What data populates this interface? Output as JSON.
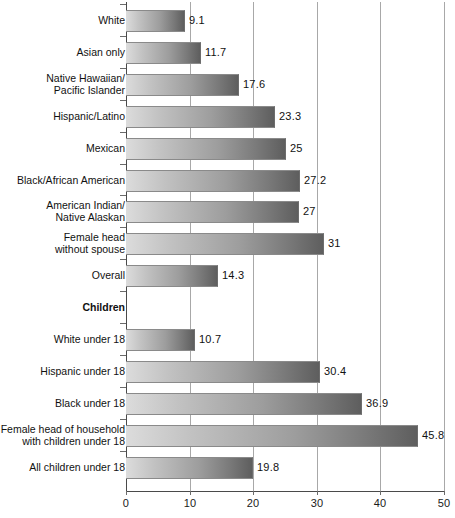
{
  "chart_data": {
    "type": "bar",
    "orientation": "horizontal",
    "title": "",
    "subtitle": "",
    "xlabel": "",
    "ylabel": "",
    "xlim": [
      0,
      50
    ],
    "xticks": [
      0,
      10,
      20,
      30,
      40,
      50
    ],
    "xtick_labels": [
      "0",
      "10",
      "20",
      "30",
      "40",
      "50"
    ],
    "grid": "vertical",
    "legend": "none",
    "categories": [
      "White",
      "Asian only",
      "Native Hawaiian/\nPacific Islander",
      "Hispanic/Latino",
      "Mexican",
      "Black/African American",
      "American Indian/\nNative Alaskan",
      "Female head\nwithout spouse",
      "Overall",
      "Children",
      "White under 18",
      "Hispanic under 18",
      "Black under 18",
      "Female head of household\nwith children under 18",
      "All children under 18"
    ],
    "values": [
      9.1,
      11.7,
      17.6,
      23.3,
      25,
      27.2,
      27,
      31,
      14.3,
      null,
      10.7,
      30.4,
      36.9,
      45.8,
      19.8
    ],
    "value_labels": [
      "9.1",
      "11.7",
      "17.6",
      "23.3",
      "25",
      "27.2",
      "27",
      "31",
      "14.3",
      "",
      "10.7",
      "30.4",
      "36.9",
      "45.8",
      "19.8"
    ],
    "section_headers": [
      "Children"
    ],
    "colors": {
      "bar_gradient_start": "#dcdcdc",
      "bar_gradient_end": "#5e5e5e",
      "bar_border": "#8a8a8a",
      "gridline": "#a8a8a8",
      "axis": "#4a4a4a",
      "text": "#111111",
      "background": "#ffffff"
    }
  },
  "rows": [
    {
      "label": "White",
      "value_label": "9.1",
      "is_header": false
    },
    {
      "label": "Asian only",
      "value_label": "11.7",
      "is_header": false
    },
    {
      "label": "Native Hawaiian/\nPacific Islander",
      "value_label": "17.6",
      "is_header": false
    },
    {
      "label": "Hispanic/Latino",
      "value_label": "23.3",
      "is_header": false
    },
    {
      "label": "Mexican",
      "value_label": "25",
      "is_header": false
    },
    {
      "label": "Black/African American",
      "value_label": "27.2",
      "is_header": false
    },
    {
      "label": "American Indian/\nNative Alaskan",
      "value_label": "27",
      "is_header": false
    },
    {
      "label": "Female head\nwithout spouse",
      "value_label": "31",
      "is_header": false
    },
    {
      "label": "Overall",
      "value_label": "14.3",
      "is_header": false
    },
    {
      "label": "Children",
      "value_label": "",
      "is_header": true
    },
    {
      "label": "White under 18",
      "value_label": "10.7",
      "is_header": false
    },
    {
      "label": "Hispanic under 18",
      "value_label": "30.4",
      "is_header": false
    },
    {
      "label": "Black under 18",
      "value_label": "36.9",
      "is_header": false
    },
    {
      "label": "Female head of household\nwith children under 18",
      "value_label": "45.8",
      "is_header": false
    },
    {
      "label": "All children under 18",
      "value_label": "19.8",
      "is_header": false
    }
  ],
  "axis": {
    "ticks": [
      "0",
      "10",
      "20",
      "30",
      "40",
      "50"
    ]
  }
}
